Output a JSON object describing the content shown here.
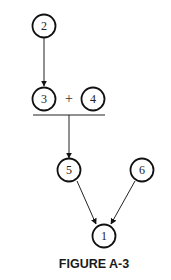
{
  "figure": {
    "caption": "FIGURE A-3",
    "plus_sign": "+",
    "nodes": [
      {
        "id": "2",
        "label": "2"
      },
      {
        "id": "3",
        "label": "3"
      },
      {
        "id": "4",
        "label": "4"
      },
      {
        "id": "5",
        "label": "5"
      },
      {
        "id": "6",
        "label": "6"
      },
      {
        "id": "1",
        "label": "1"
      }
    ],
    "edges": [
      {
        "from": "2",
        "to": "3"
      },
      {
        "from": "3+4",
        "to": "5"
      },
      {
        "from": "5",
        "to": "1"
      },
      {
        "from": "6",
        "to": "1"
      }
    ],
    "colors": {
      "stroke": "#111111",
      "background": "#ffffff"
    }
  }
}
